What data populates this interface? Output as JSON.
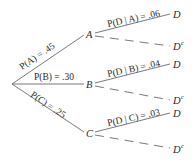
{
  "diagram": {
    "type": "probability-tree",
    "root": "start",
    "first_level": [
      {
        "node": "A",
        "edge_label": "P(A) = .45"
      },
      {
        "node": "B",
        "edge_label": "P(B) = .30"
      },
      {
        "node": "C",
        "edge_label": "P(C) = .25"
      }
    ],
    "second_level": [
      {
        "parent": "A",
        "branches": [
          {
            "node": "D",
            "edge_label": "P(D | A) = .06",
            "style": "solid"
          },
          {
            "node": "D",
            "superscript": "c",
            "edge_label": "",
            "style": "dashed"
          }
        ]
      },
      {
        "parent": "B",
        "branches": [
          {
            "node": "D",
            "edge_label": "P(D | B) = .04",
            "style": "solid"
          },
          {
            "node": "D",
            "superscript": "c",
            "edge_label": "",
            "style": "dashed"
          }
        ]
      },
      {
        "parent": "C",
        "branches": [
          {
            "node": "D",
            "edge_label": "P(D | C) = .03",
            "style": "solid"
          },
          {
            "node": "D",
            "superscript": "c",
            "edge_label": "",
            "style": "dashed"
          }
        ]
      }
    ]
  }
}
